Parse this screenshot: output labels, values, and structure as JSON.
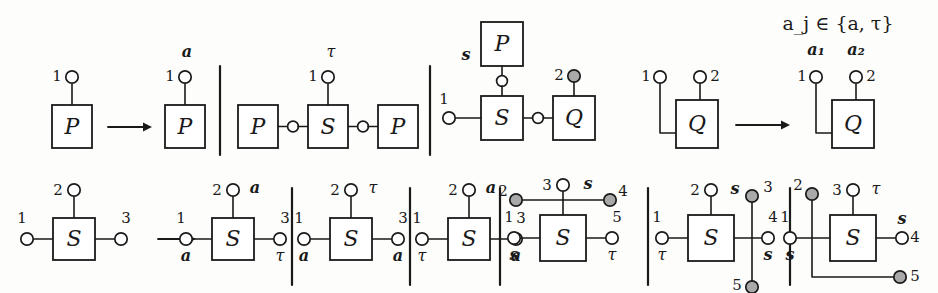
{
  "figure": {
    "kind": "process-algebra-transition-rule-diagram",
    "condition_note": "a_j ∈ {a, τ}",
    "port_label_a1": "a₁",
    "port_label_a2": "a₂",
    "glyphs": {
      "node_P": "P",
      "node_S": "S",
      "node_Q": "Q",
      "action_a": "a",
      "action_tau": "τ",
      "action_s": "s",
      "arrow": "→"
    }
  },
  "top_row": {
    "panels": [
      {
        "id": "p1-left",
        "name": "p-unlabelled",
        "box": "P",
        "ports": [
          {
            "num": "1",
            "action": "",
            "filled": false
          }
        ]
      },
      {
        "id": "p1-right",
        "name": "p-labelled-a",
        "box": "P",
        "ports": [
          {
            "num": "1",
            "action": "a",
            "filled": false
          }
        ]
      },
      {
        "id": "p2",
        "name": "p-s-p-chain",
        "boxes": [
          "P",
          "S",
          "P"
        ],
        "ports": [
          {
            "num": "1",
            "action": "τ",
            "filled": false
          }
        ]
      },
      {
        "id": "p3",
        "name": "s-p-q-composite",
        "boxes": [
          "P",
          "S",
          "Q"
        ],
        "ports": [
          {
            "num": "1",
            "action": "",
            "filled": false
          },
          {
            "num": "2",
            "action": "",
            "filled": true
          }
        ],
        "side_action": "s"
      },
      {
        "id": "p4-left",
        "name": "q-two-port",
        "box": "Q",
        "ports": [
          {
            "num": "1",
            "action": "",
            "filled": false
          },
          {
            "num": "2",
            "action": "",
            "filled": false
          }
        ]
      },
      {
        "id": "p4-right",
        "name": "q-two-port-labelled",
        "box": "Q",
        "ports": [
          {
            "num": "1",
            "action": "a₁",
            "filled": false
          },
          {
            "num": "2",
            "action": "a₂",
            "filled": false
          }
        ]
      }
    ]
  },
  "bottom_row": {
    "panels": [
      {
        "id": "b1",
        "name": "s-three-port-plain",
        "box": "S",
        "ports": [
          {
            "num": "1",
            "action": "",
            "filled": false
          },
          {
            "num": "2",
            "action": "",
            "filled": false
          },
          {
            "num": "3",
            "action": "",
            "filled": false
          }
        ]
      },
      {
        "id": "b2",
        "name": "s-a-a-tau",
        "box": "S",
        "ports": [
          {
            "num": "1",
            "action": "a",
            "filled": false
          },
          {
            "num": "2",
            "action": "a",
            "filled": false
          },
          {
            "num": "3",
            "action": "τ",
            "filled": false
          }
        ]
      },
      {
        "id": "b3",
        "name": "s-a-tau-a",
        "box": "S",
        "ports": [
          {
            "num": "1",
            "action": "a",
            "filled": false
          },
          {
            "num": "2",
            "action": "τ",
            "filled": false
          },
          {
            "num": "3",
            "action": "a",
            "filled": false
          }
        ]
      },
      {
        "id": "b4",
        "name": "s-tau-a-a",
        "box": "S",
        "ports": [
          {
            "num": "1",
            "action": "τ",
            "filled": false
          },
          {
            "num": "2",
            "action": "a",
            "filled": false
          },
          {
            "num": "3",
            "action": "a",
            "filled": false
          }
        ]
      },
      {
        "id": "b5",
        "name": "s-five-port-horizontal-bar",
        "box": "S",
        "ports": [
          {
            "num": "1",
            "action": "s",
            "filled": false
          },
          {
            "num": "2",
            "action": "",
            "filled": true
          },
          {
            "num": "3",
            "action": "s",
            "filled": false
          },
          {
            "num": "4",
            "action": "",
            "filled": true
          },
          {
            "num": "5",
            "action": "τ",
            "filled": false
          }
        ]
      },
      {
        "id": "b6",
        "name": "s-five-port-vertical-bar",
        "box": "S",
        "ports": [
          {
            "num": "1",
            "action": "τ",
            "filled": false
          },
          {
            "num": "2",
            "action": "s",
            "filled": false
          },
          {
            "num": "3",
            "action": "",
            "filled": true
          },
          {
            "num": "4",
            "action": "s",
            "filled": false
          },
          {
            "num": "5",
            "action": "",
            "filled": true
          }
        ]
      },
      {
        "id": "b7",
        "name": "s-five-port-elbow-bar",
        "box": "S",
        "ports": [
          {
            "num": "1",
            "action": "s",
            "filled": false
          },
          {
            "num": "2",
            "action": "",
            "filled": true
          },
          {
            "num": "3",
            "action": "τ",
            "filled": false
          },
          {
            "num": "4",
            "action": "s",
            "filled": false
          },
          {
            "num": "5",
            "action": "",
            "filled": true
          }
        ]
      }
    ]
  },
  "style": {
    "stroke": "#1a1a1a",
    "fill_open": "#ffffff",
    "fill_closed": "#a9a9a9",
    "background": "#fdfdfb"
  }
}
